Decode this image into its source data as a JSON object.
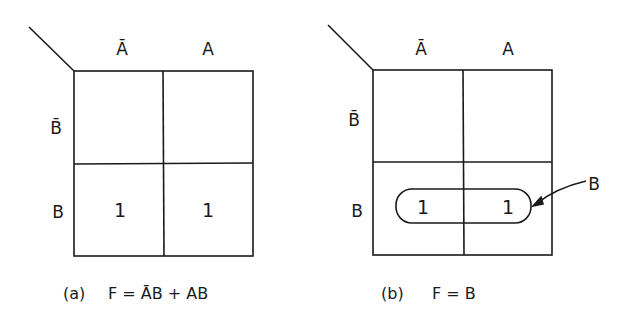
{
  "diagrams": [
    {
      "id": "a",
      "col_labels": [
        "Ā",
        "A"
      ],
      "row_labels": [
        "B̄",
        "B"
      ],
      "cells": [
        [
          "",
          ""
        ],
        [
          "1",
          "1"
        ]
      ],
      "caption_prefix": "(a)",
      "caption_expr": "F = ĀB + AB"
    },
    {
      "id": "b",
      "col_labels": [
        "Ā",
        "A"
      ],
      "row_labels": [
        "B̄",
        "B"
      ],
      "cells": [
        [
          "",
          ""
        ],
        [
          "1",
          "1"
        ]
      ],
      "group_label": "B",
      "caption_prefix": "(b)",
      "caption_expr": "F = B"
    }
  ],
  "colors": {
    "ink": "#1a1a1a",
    "background": "#ffffff"
  }
}
